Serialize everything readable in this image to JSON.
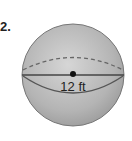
{
  "problem": {
    "number": "2.",
    "shape": "sphere",
    "measurement_label": "12 ft",
    "measurement_type": "diameter"
  },
  "colors": {
    "sphere_fill": "#b8b8b8",
    "line": "#555555",
    "text": "#222222"
  }
}
